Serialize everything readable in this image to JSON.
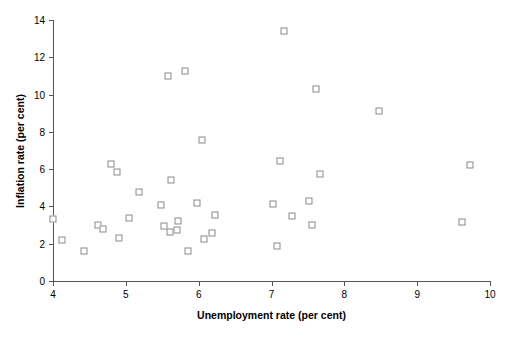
{
  "chart_data": {
    "type": "scatter",
    "title": "",
    "xlabel": "Unemployment rate (per cent)",
    "ylabel": "Inflation rate (per cent)",
    "xlim": [
      4,
      10
    ],
    "ylim": [
      0,
      14
    ],
    "xticks": [
      4,
      5,
      6,
      7,
      8,
      9,
      10
    ],
    "xticklabels": [
      "4",
      "5",
      "6",
      "7",
      "8",
      "9",
      "10"
    ],
    "yticks": [
      0,
      2,
      4,
      6,
      8,
      10,
      12,
      14
    ],
    "yticklabels": [
      "0",
      "2",
      "4",
      "6",
      "8",
      "10",
      "12",
      "14"
    ],
    "grid": false,
    "legend": null,
    "marker": "open-square",
    "marker_color": "#8a8a8a",
    "marker_fill": "#ffffff",
    "axis_color": "#555555",
    "points": [
      {
        "x": 4.0,
        "y": 3.35
      },
      {
        "x": 4.12,
        "y": 2.2
      },
      {
        "x": 4.42,
        "y": 1.6
      },
      {
        "x": 4.62,
        "y": 3.0
      },
      {
        "x": 4.68,
        "y": 2.8
      },
      {
        "x": 4.8,
        "y": 6.3
      },
      {
        "x": 4.88,
        "y": 5.85
      },
      {
        "x": 4.9,
        "y": 2.3
      },
      {
        "x": 5.05,
        "y": 3.4
      },
      {
        "x": 5.18,
        "y": 4.75
      },
      {
        "x": 5.48,
        "y": 4.1
      },
      {
        "x": 5.52,
        "y": 2.95
      },
      {
        "x": 5.58,
        "y": 11.0
      },
      {
        "x": 5.6,
        "y": 2.65
      },
      {
        "x": 5.62,
        "y": 5.4
      },
      {
        "x": 5.7,
        "y": 2.75
      },
      {
        "x": 5.72,
        "y": 3.2
      },
      {
        "x": 5.81,
        "y": 11.25
      },
      {
        "x": 5.85,
        "y": 1.6
      },
      {
        "x": 5.98,
        "y": 4.2
      },
      {
        "x": 6.05,
        "y": 7.55
      },
      {
        "x": 6.08,
        "y": 2.25
      },
      {
        "x": 6.18,
        "y": 2.55
      },
      {
        "x": 6.22,
        "y": 3.55
      },
      {
        "x": 7.02,
        "y": 4.15
      },
      {
        "x": 7.08,
        "y": 1.9
      },
      {
        "x": 7.12,
        "y": 6.45
      },
      {
        "x": 7.17,
        "y": 13.4
      },
      {
        "x": 7.28,
        "y": 3.5
      },
      {
        "x": 7.52,
        "y": 4.3
      },
      {
        "x": 7.55,
        "y": 3.0
      },
      {
        "x": 7.61,
        "y": 10.3
      },
      {
        "x": 7.66,
        "y": 5.75
      },
      {
        "x": 8.47,
        "y": 9.1
      },
      {
        "x": 9.62,
        "y": 3.15
      },
      {
        "x": 9.72,
        "y": 6.2
      }
    ]
  }
}
